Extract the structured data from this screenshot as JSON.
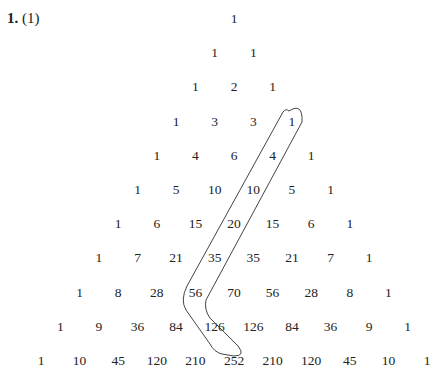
{
  "problem": {
    "number": "1.",
    "part": "(1)"
  },
  "triangle": [
    [
      "1"
    ],
    [
      "1",
      "1"
    ],
    [
      "1",
      "2",
      "1"
    ],
    [
      "1",
      "3",
      "3",
      "1"
    ],
    [
      "1",
      "4",
      "6",
      "4",
      "1"
    ],
    [
      "1",
      "5",
      "10",
      "10",
      "5",
      "1"
    ],
    [
      "1",
      "6",
      "15",
      "20",
      "15",
      "6",
      "1"
    ],
    [
      "1",
      "7",
      "21",
      "35",
      "35",
      "21",
      "7",
      "1"
    ],
    [
      "1",
      "8",
      "28",
      "56",
      "70",
      "56",
      "28",
      "8",
      "1"
    ],
    [
      "1",
      "9",
      "36",
      "84",
      "126",
      "126",
      "84",
      "36",
      "9",
      "1"
    ],
    [
      "1",
      "10",
      "45",
      "120",
      "210",
      "252",
      "210",
      "120",
      "45",
      "10",
      "1"
    ]
  ],
  "highlighted_diagonal": [
    "1",
    "4",
    "10",
    "20",
    "35",
    "56",
    "126"
  ]
}
